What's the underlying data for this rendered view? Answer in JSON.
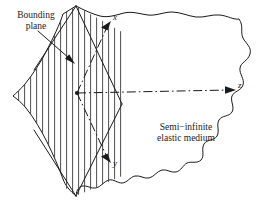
{
  "figure": {
    "caption_labels": {
      "bounding_plane": "Bounding\nplane",
      "medium": "Semi−infinite\nelastic medium"
    },
    "axes": {
      "x": "x",
      "y": "y",
      "z": "z"
    },
    "colors": {
      "stroke": "#1a1a1a",
      "background": "#ffffff",
      "hatch": "#3a3a3a"
    },
    "geometry": {
      "origin": {
        "x": 77,
        "y": 93
      },
      "x_axis_tip": {
        "x": 112,
        "y": 22
      },
      "y_axis_tip": {
        "x": 112,
        "y": 163
      },
      "z_axis_tip": {
        "x": 236,
        "y": 90
      },
      "hatch_spacing": 6,
      "hatch_direction": "vertical"
    },
    "annotation_arrow": {
      "from": {
        "x": 38,
        "y": 31
      },
      "to": {
        "x": 75,
        "y": 64
      }
    }
  }
}
